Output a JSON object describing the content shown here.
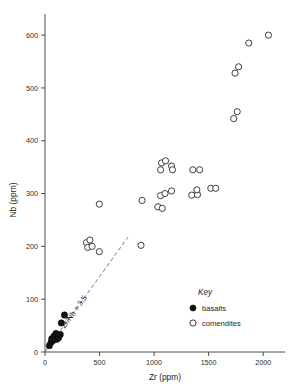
{
  "figure": {
    "background_color": "#ffffff",
    "ghost_header": "",
    "point_filled_color": "#111111",
    "point_open_stroke": "#2a2a2a",
    "axis_color": "#3a3a3a"
  },
  "legend": {
    "title": "Key",
    "entries": [
      {
        "marker": "filled-circle",
        "label": "basalts"
      },
      {
        "marker": "open-circle",
        "label": "comendites"
      }
    ]
  },
  "annotation": {
    "ref_line_label": "Zr/Nb = 3.5",
    "ref_line_ratio": 3.5,
    "ref_line_style": "dashed"
  },
  "chart_data": {
    "type": "scatter",
    "title": "",
    "xlabel": "Zr (ppm)",
    "ylabel": "Nb (ppm)",
    "xlim": [
      0,
      2200
    ],
    "ylim": [
      0,
      640
    ],
    "xticks": [
      0,
      500,
      1000,
      1500,
      2000
    ],
    "yticks": [
      0,
      100,
      200,
      300,
      400,
      500,
      600
    ],
    "xtick_labels": [
      "0",
      "500",
      "1000",
      "1500",
      "2000"
    ],
    "ytick_labels": [
      "0",
      "100",
      "200",
      "300",
      "400",
      "500",
      "600"
    ],
    "grid": false,
    "legend_position": "lower-right",
    "series": [
      {
        "name": "basalts",
        "marker": "filled-circle",
        "points": [
          [
            40,
            12
          ],
          [
            55,
            18
          ],
          [
            62,
            25
          ],
          [
            75,
            22
          ],
          [
            82,
            30
          ],
          [
            95,
            28
          ],
          [
            100,
            35
          ],
          [
            108,
            24
          ],
          [
            118,
            30
          ],
          [
            125,
            27
          ],
          [
            140,
            33
          ],
          [
            150,
            55
          ],
          [
            178,
            70
          ]
        ]
      },
      {
        "name": "comendites",
        "marker": "open-circle",
        "points": [
          [
            380,
            207
          ],
          [
            392,
            198
          ],
          [
            412,
            212
          ],
          [
            432,
            200
          ],
          [
            498,
            190
          ],
          [
            498,
            280
          ],
          [
            880,
            202
          ],
          [
            890,
            287
          ],
          [
            1035,
            275
          ],
          [
            1075,
            272
          ],
          [
            1060,
            296
          ],
          [
            1100,
            300
          ],
          [
            1160,
            305
          ],
          [
            1060,
            345
          ],
          [
            1068,
            358
          ],
          [
            1105,
            362
          ],
          [
            1160,
            352
          ],
          [
            1168,
            345
          ],
          [
            1345,
            297
          ],
          [
            1398,
            298
          ],
          [
            1355,
            345
          ],
          [
            1418,
            345
          ],
          [
            1392,
            307
          ],
          [
            1520,
            310
          ],
          [
            1565,
            310
          ],
          [
            1730,
            442
          ],
          [
            1762,
            455
          ],
          [
            1742,
            528
          ],
          [
            1775,
            540
          ],
          [
            1868,
            585
          ],
          [
            2048,
            600
          ]
        ]
      }
    ]
  }
}
